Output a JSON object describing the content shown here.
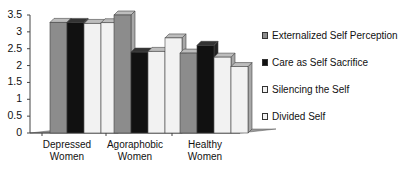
{
  "chart_data": {
    "type": "bar",
    "style": "3d-clustered-column",
    "title": "",
    "xlabel": "",
    "ylabel": "",
    "categories": [
      "Depressed Women",
      "Agoraphobic Women",
      "Healthy Women"
    ],
    "category_lines": [
      [
        "Depressed",
        "Women"
      ],
      [
        "Agoraphobic",
        "Women"
      ],
      [
        "Healthy",
        "Women"
      ]
    ],
    "series": [
      {
        "name": "Externalized Self Perception",
        "color": "#8c8c8c",
        "values": [
          3.28,
          3.5,
          2.37
        ]
      },
      {
        "name": "Care as Self Sacrifice",
        "color": "#111111",
        "values": [
          3.28,
          2.4,
          2.6
        ]
      },
      {
        "name": "Silencing the Self",
        "color": "#f2f2f2",
        "values": [
          3.25,
          2.42,
          2.25
        ]
      },
      {
        "name": "Divided Self",
        "color": "#f2f2f2",
        "values": [
          3.27,
          2.82,
          1.97
        ]
      }
    ],
    "ylim": [
      0,
      3.5
    ],
    "yticks": [
      "0",
      "0.5",
      "1",
      "1.5",
      "2",
      "2.5",
      "3",
      "3.5"
    ],
    "grid": false,
    "legend_position": "right"
  }
}
